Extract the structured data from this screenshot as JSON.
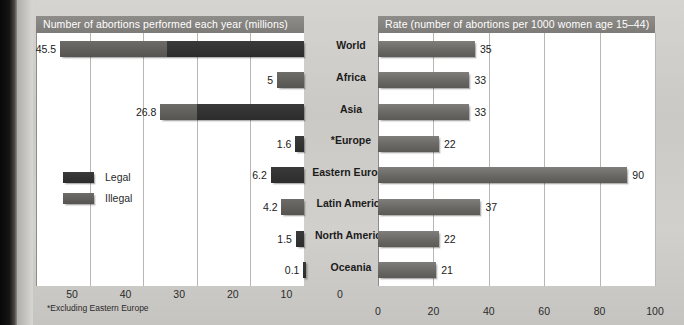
{
  "figure": {
    "footnote": "*Excluding Eastern Europe",
    "categories": [
      "World",
      "Africa",
      "Asia",
      "*Europe",
      "Eastern Europe",
      "Latin America",
      "North America",
      "Oceania"
    ]
  },
  "legend": {
    "items": [
      {
        "label": "Legal",
        "color": "#3a3a3a"
      },
      {
        "label": "Illegal",
        "color": "#6e6c68"
      }
    ]
  },
  "chart_data": [
    {
      "type": "bar",
      "title": "Number of abortions performed each year (millions)",
      "orientation": "horizontal",
      "direction": "right-to-left",
      "xlabel": "",
      "ylabel": "",
      "xlim": [
        0,
        50
      ],
      "ticks": [
        50,
        40,
        30,
        20,
        10,
        0
      ],
      "grid": true,
      "legend_position": "inside-left",
      "categories": [
        "World",
        "Africa",
        "Asia",
        "*Europe",
        "Eastern Europe",
        "Latin America",
        "North America",
        "Oceania"
      ],
      "values": [
        45.5,
        5,
        26.8,
        1.6,
        6.2,
        4.2,
        1.5,
        0.1
      ],
      "labels": [
        "45.5",
        "5",
        "26.8",
        "1.6",
        "6.2",
        "4.2",
        "1.5",
        "0.1"
      ],
      "series": [
        {
          "name": "Legal",
          "values": [
            25.6,
            0,
            20.0,
            1.6,
            6.2,
            0,
            1.5,
            0.1
          ]
        },
        {
          "name": "Illegal",
          "values": [
            19.9,
            5,
            6.8,
            0,
            0,
            4.2,
            0,
            0
          ]
        }
      ],
      "note": "*Excluding Eastern Europe"
    },
    {
      "type": "bar",
      "title": "Rate (number of abortions per 1000 women age 15–44)",
      "orientation": "horizontal",
      "direction": "left-to-right",
      "xlabel": "",
      "ylabel": "",
      "xlim": [
        0,
        100
      ],
      "ticks": [
        0,
        20,
        40,
        60,
        80,
        100
      ],
      "grid": true,
      "categories": [
        "World",
        "Africa",
        "Asia",
        "*Europe",
        "Eastern Europe",
        "Latin America",
        "North America",
        "Oceania"
      ],
      "values": [
        35,
        33,
        33,
        22,
        90,
        37,
        22,
        21
      ],
      "labels": [
        "35",
        "33",
        "33",
        "22",
        "90",
        "37",
        "22",
        "21"
      ]
    }
  ]
}
